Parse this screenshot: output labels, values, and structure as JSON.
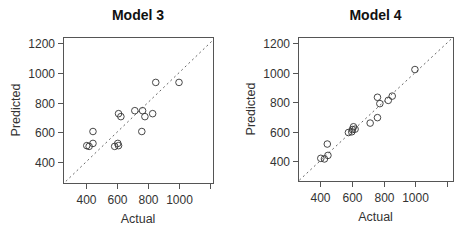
{
  "chart_data": [
    {
      "type": "scatter",
      "title": "Model 3",
      "xlabel": "Actual",
      "ylabel": "Predicted",
      "xlim": [
        270,
        1220
      ],
      "ylim": [
        270,
        1240
      ],
      "xticks": [
        400,
        600,
        800,
        1000,
        1200
      ],
      "xtick_labels": [
        "400",
        "600",
        "800",
        "1000",
        ""
      ],
      "yticks": [
        400,
        600,
        800,
        1000,
        1200
      ],
      "ytick_labels": [
        "400",
        "600",
        "800",
        "1000",
        "1200"
      ],
      "reference_line": "y = x (dashed)",
      "grid": false,
      "marker": "open circle",
      "x": [
        405,
        420,
        445,
        445,
        585,
        605,
        610,
        610,
        625,
        715,
        765,
        760,
        780,
        830,
        850,
        1000
      ],
      "y": [
        510,
        505,
        525,
        605,
        505,
        525,
        510,
        725,
        705,
        745,
        745,
        605,
        705,
        725,
        935,
        935
      ]
    },
    {
      "type": "scatter",
      "title": "Model 4",
      "xlabel": "Actual",
      "ylabel": "Predicted",
      "xlim": [
        270,
        1220
      ],
      "ylim": [
        270,
        1240
      ],
      "xticks": [
        400,
        600,
        800,
        1000,
        1200
      ],
      "xtick_labels": [
        "400",
        "600",
        "800",
        "1000",
        ""
      ],
      "yticks": [
        400,
        600,
        800,
        1000,
        1200
      ],
      "ytick_labels": [
        "400",
        "600",
        "800",
        "1000",
        "1200"
      ],
      "reference_line": "y = x (dashed)",
      "grid": false,
      "marker": "open circle",
      "x": [
        405,
        428,
        450,
        446,
        579,
        600,
        611,
        621,
        604,
        716,
        762,
        762,
        777,
        830,
        855,
        998
      ],
      "y": [
        418,
        414,
        438,
        515,
        593,
        598,
        632,
        616,
        613,
        657,
        694,
        832,
        789,
        811,
        840,
        1020
      ]
    }
  ],
  "panels": [
    {
      "title": "Model 3",
      "xlabel": "Actual",
      "ylabel": "Predicted"
    },
    {
      "title": "Model 4",
      "xlabel": "Actual",
      "ylabel": "Predicted"
    }
  ]
}
